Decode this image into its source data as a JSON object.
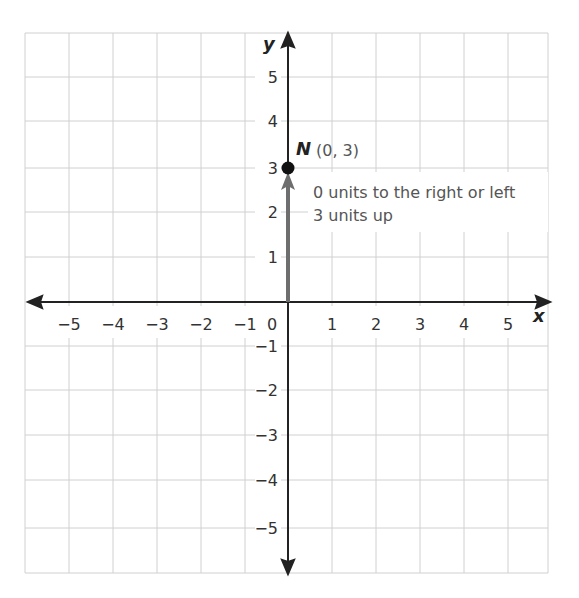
{
  "graph": {
    "x_axis_label": "x",
    "y_axis_label": "y",
    "x_ticks": [
      "−5",
      "−4",
      "−3",
      "−2",
      "−1",
      "1",
      "2",
      "3",
      "4",
      "5"
    ],
    "y_ticks": [
      "5",
      "4",
      "3",
      "2",
      "1",
      "−1",
      "−2",
      "−3",
      "−4",
      "−5"
    ],
    "origin_label": "0",
    "point": {
      "name": "N",
      "coords": "(0, 3)",
      "x": 0,
      "y": 3
    },
    "annotation_line1": "0 units to the right or left",
    "annotation_line2": "3 units up",
    "colors": {
      "grid": "#cfcfcf",
      "axis": "#222222",
      "vector": "#6e6e6e",
      "point": "#111111"
    }
  }
}
